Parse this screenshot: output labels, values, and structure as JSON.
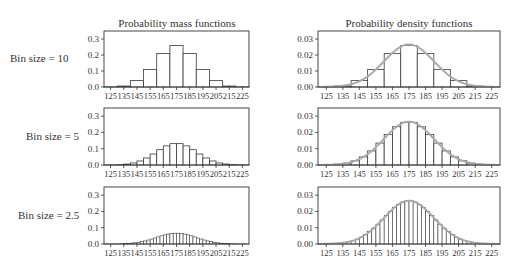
{
  "figure": {
    "column_titles": [
      "Probability mass functions",
      "Probability density functions"
    ],
    "row_labels": [
      "Bin size = 10",
      "Bin size = 5",
      "Bin size = 2.5"
    ],
    "x_ticks": [
      125,
      135,
      145,
      155,
      165,
      175,
      185,
      195,
      205,
      215,
      225
    ],
    "pmf_y_ticks": [
      "0.0",
      "0.1",
      "0.2",
      "0.3"
    ],
    "pdf_y_ticks": [
      "0.00",
      "0.01",
      "0.02",
      "0.03"
    ],
    "colors": {
      "axis": "#333333",
      "bar_edge": "#3a3a3a",
      "curve": "#aaaaaa"
    }
  },
  "chart_data": [
    {
      "type": "bar",
      "title": "Probability mass functions",
      "row": "Bin size = 10",
      "xlabel": "",
      "ylabel": "",
      "xlim": [
        120,
        230
      ],
      "ylim": [
        0,
        0.35
      ],
      "bin_width": 10,
      "distribution": {
        "mean": 175,
        "sd": 15
      },
      "categories": [
        125,
        135,
        145,
        155,
        165,
        175,
        185,
        195,
        205,
        215,
        225
      ],
      "values": [
        0.001,
        0.006,
        0.04,
        0.11,
        0.21,
        0.26,
        0.21,
        0.11,
        0.04,
        0.006,
        0.001
      ]
    },
    {
      "type": "bar",
      "title": "Probability density functions",
      "row": "Bin size = 10",
      "xlim": [
        120,
        230
      ],
      "ylim": [
        0,
        0.035
      ],
      "bin_width": 10,
      "overlay": "normal pdf curve (mean 175, sd 15)",
      "categories": [
        125,
        135,
        145,
        155,
        165,
        175,
        185,
        195,
        205,
        215,
        225
      ],
      "values": [
        0.0001,
        0.0006,
        0.004,
        0.011,
        0.021,
        0.026,
        0.021,
        0.011,
        0.004,
        0.0006,
        0.0001
      ]
    },
    {
      "type": "bar",
      "title": "Probability mass functions",
      "row": "Bin size = 5",
      "xlim": [
        120,
        230
      ],
      "ylim": [
        0,
        0.35
      ],
      "bin_width": 5,
      "distribution": {
        "mean": 175,
        "sd": 15
      },
      "note": "bar heights ~ half of bin-size-10 values, peak ~0.13"
    },
    {
      "type": "bar",
      "title": "Probability density functions",
      "row": "Bin size = 5",
      "xlim": [
        120,
        230
      ],
      "ylim": [
        0,
        0.035
      ],
      "bin_width": 5,
      "overlay": "normal pdf curve (mean 175, sd 15)",
      "note": "bar heights follow pdf, peak ~0.026"
    },
    {
      "type": "bar",
      "title": "Probability mass functions",
      "row": "Bin size = 2.5",
      "xlim": [
        120,
        230
      ],
      "ylim": [
        0,
        0.35
      ],
      "bin_width": 2.5,
      "distribution": {
        "mean": 175,
        "sd": 15
      },
      "note": "bar heights ~ quarter of bin-size-10 values, peak ~0.066"
    },
    {
      "type": "bar",
      "title": "Probability density functions",
      "row": "Bin size = 2.5",
      "xlim": [
        120,
        230
      ],
      "ylim": [
        0,
        0.035
      ],
      "bin_width": 2.5,
      "overlay": "normal pdf curve (mean 175, sd 15)",
      "note": "bar heights follow pdf, peak ~0.026"
    }
  ]
}
